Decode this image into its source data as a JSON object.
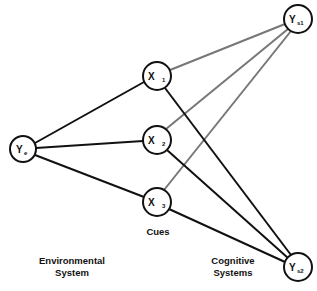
{
  "diagram": {
    "type": "lens-model",
    "colors": {
      "solid_edge": "#111111",
      "gray_edge": "#777777",
      "node_stroke": "#111111",
      "background": "#ffffff"
    },
    "nodes": {
      "ye": {
        "main": "Y",
        "sub": "e",
        "cx": 23,
        "cy": 149
      },
      "x1": {
        "main": "X",
        "sub": "1",
        "cx": 157,
        "cy": 76
      },
      "x2": {
        "main": "X",
        "sub": "2",
        "cx": 157,
        "cy": 140
      },
      "x3": {
        "main": "X",
        "sub": "3",
        "cx": 157,
        "cy": 202
      },
      "ys1": {
        "main": "Y",
        "sub": "s1",
        "cx": 298,
        "cy": 19
      },
      "ys2": {
        "main": "Y",
        "sub": "s2",
        "cx": 298,
        "cy": 267
      }
    },
    "edges": [
      {
        "from": "ye",
        "to": "x1",
        "style": "solid"
      },
      {
        "from": "ye",
        "to": "x2",
        "style": "solid"
      },
      {
        "from": "ye",
        "to": "x3",
        "style": "solid"
      },
      {
        "from": "x1",
        "to": "ys1",
        "style": "gray"
      },
      {
        "from": "x2",
        "to": "ys1",
        "style": "gray"
      },
      {
        "from": "x3",
        "to": "ys1",
        "style": "gray"
      },
      {
        "from": "x1",
        "to": "ys2",
        "style": "solid"
      },
      {
        "from": "x2",
        "to": "ys2",
        "style": "solid"
      },
      {
        "from": "x3",
        "to": "ys2",
        "style": "solid"
      }
    ],
    "labels": {
      "cues": "Cues",
      "environmental_line1": "Environmental",
      "environmental_line2": "System",
      "cognitive_line1": "Cognitive",
      "cognitive_line2": "Systems"
    }
  }
}
